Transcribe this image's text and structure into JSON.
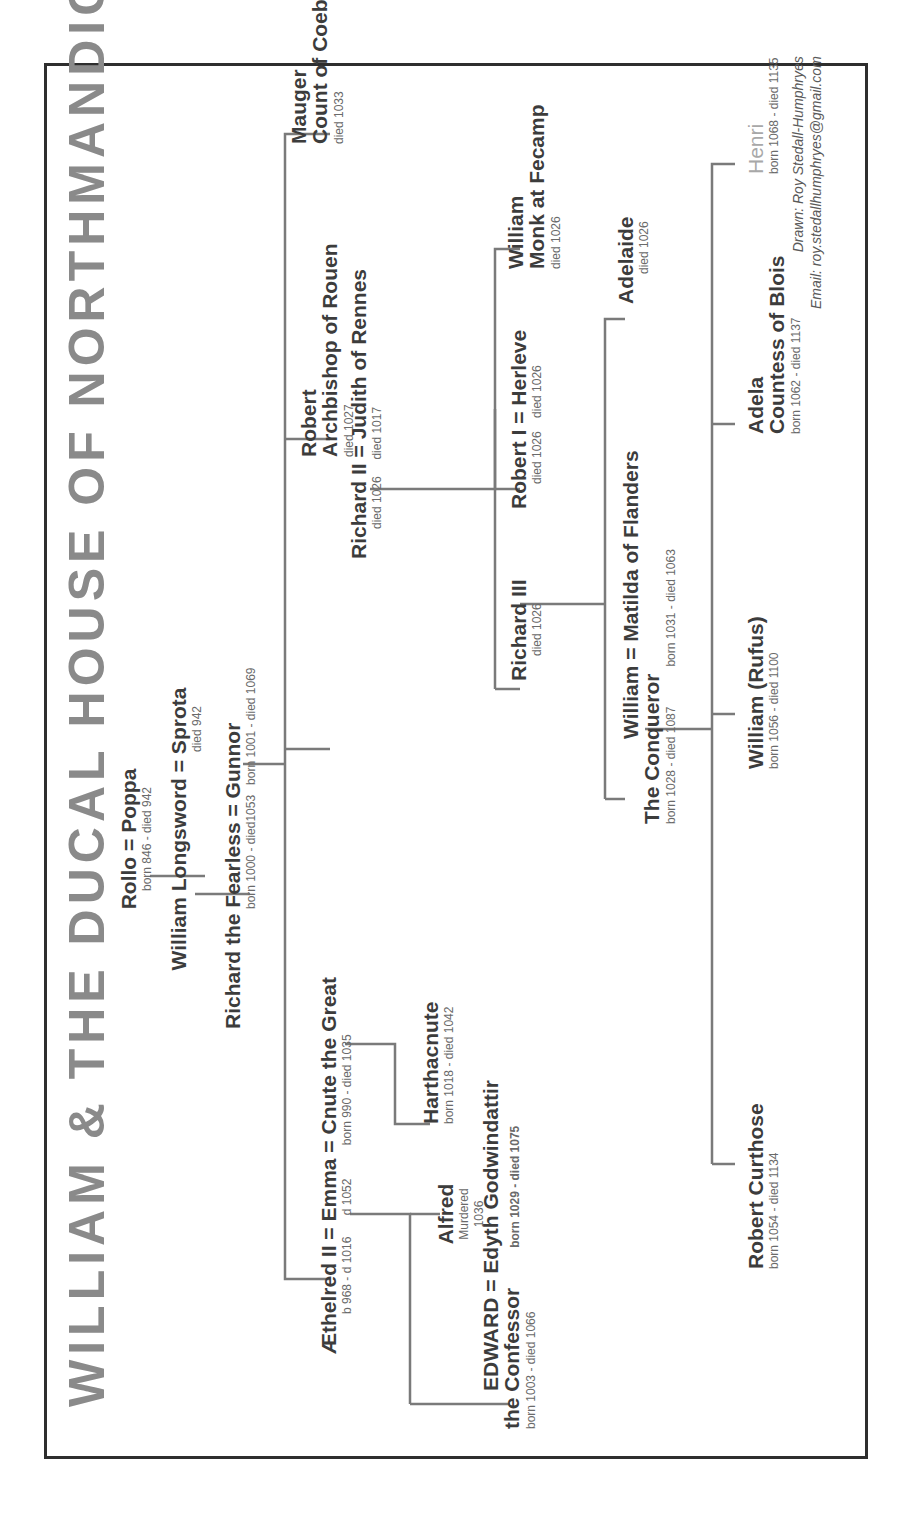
{
  "title": "WILLIAM & THE DUCAL HOUSE OF NORTHMANDIG",
  "orientation": "rotated 90 degrees counter-clockwise",
  "generations": [
    {
      "id": "rollo",
      "couple": {
        "a": "Rollo",
        "b": "Poppa"
      },
      "dates": "born 846 - died 942"
    },
    {
      "id": "longsword",
      "couple": {
        "a": "William Longsword",
        "b": "Sprota"
      },
      "dates": "died 942"
    },
    {
      "id": "fearless",
      "couple": {
        "a": "Richard the Fearless",
        "b": "Gunnor"
      },
      "dates_a": "born 1000 - died1053",
      "dates_b": "born 1001 - died 1069"
    }
  ],
  "children_of_fearless": [
    {
      "id": "emma-line",
      "people": [
        {
          "name": "Æthelred II",
          "dates": "b 968 - d 1016"
        },
        {
          "name": "Emma",
          "dates": "d 1052"
        },
        {
          "name": "Cnute the Great",
          "dates": "born 990 - died 1035"
        }
      ]
    },
    {
      "id": "richard-ii",
      "name": "Richard II",
      "dates": "died 1026",
      "spouse": {
        "name": "Judith of Rennes",
        "dates": "died 1017"
      }
    },
    {
      "id": "robert-archbishop",
      "name_line1": "Robert",
      "name_line2": "Archbishop of Rouen",
      "dates": "died 1027"
    },
    {
      "id": "mauger",
      "name_line1": "Mauger",
      "name_line2": "Count of Coebeil",
      "dates": "died 1033"
    }
  ],
  "children_of_emma_aethelred": [
    {
      "id": "edward",
      "name_line1": "EDWARD",
      "name_line2": "the Confessor",
      "dates": "born 1003 - died 1066",
      "spouse": {
        "name": "Edyth Godwindattir",
        "dates": "born 1029 - died 1075"
      }
    },
    {
      "id": "alfred",
      "name": "Alfred",
      "dates_line1": "Murdered",
      "dates_line2": "1036"
    }
  ],
  "children_of_emma_cnute": [
    {
      "id": "harthacnute",
      "name": "Harthacnute",
      "dates": "born 1018 - died 1042"
    }
  ],
  "children_of_richard_ii": [
    {
      "id": "richard-iii",
      "name": "Richard III",
      "dates": "died 1026"
    },
    {
      "id": "robert-i",
      "name": "Robert I",
      "dates": "died 1026",
      "spouse": {
        "name": "Herleve",
        "dates": "died 1026"
      }
    },
    {
      "id": "william-monk",
      "name_line1": "William",
      "name_line2": "Monk at Fecamp",
      "dates": "died 1026"
    }
  ],
  "children_of_robert_i": [
    {
      "id": "william-conqueror",
      "name_line1": "William",
      "name_line2": "The Conqueror",
      "dates": "born 1028 - died 1087",
      "spouse": {
        "name": "Matilda of Flanders",
        "dates": "born 1031 - died 1063"
      }
    },
    {
      "id": "adelaide",
      "name": "Adelaide",
      "dates": "died 1026"
    }
  ],
  "children_of_william": [
    {
      "id": "robert-curthose",
      "name": "Robert Curthose",
      "dates": "born 1054 - died 1134"
    },
    {
      "id": "william-rufus",
      "name": "William (Rufus)",
      "dates": "born 1056 - died 1100"
    },
    {
      "id": "adela",
      "name_line1": "Adela",
      "name_line2": "Countess of Blois",
      "dates": "born 1062 - died 1137"
    },
    {
      "id": "henri",
      "name": "Henri",
      "dates": "born 1068 - died 1135"
    }
  ],
  "symbols": {
    "marriage": "="
  },
  "credit": {
    "drawn": "Drawn: Roy Stedall-Humphryes",
    "email": "Email: roy.stedallhumphryes@gmail.com"
  },
  "colors": {
    "title": "#8a8a8a",
    "text": "#3c3c3c",
    "lines": "#7a7a7a",
    "frame": "#2e2e2e",
    "henri": "#a8a8a8"
  }
}
